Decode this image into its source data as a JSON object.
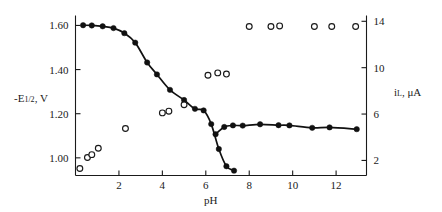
{
  "chart_data": {
    "type": "scatter",
    "title": "",
    "subtitle": "",
    "xlabel": "pH",
    "ylabel": "-E1/2, V",
    "y2label": "iL, uA",
    "xlim": [
      0.0,
      13.4
    ],
    "ylim": [
      0.92,
      1.645
    ],
    "y2lim": [
      0.7,
      14.5
    ],
    "grid": false,
    "legend": "none",
    "xticks": [
      2,
      4,
      6,
      8,
      10,
      12
    ],
    "xtick_labels": [
      "2",
      "4",
      "6",
      "8",
      "10",
      "12"
    ],
    "yticks": [
      1.0,
      1.2,
      1.4,
      1.6
    ],
    "ytick_labels": [
      "1.00",
      "1.20",
      "1.40",
      "1.60"
    ],
    "y2ticks": [
      2,
      6,
      10,
      14
    ],
    "y2tick_labels": [
      "2",
      "6",
      "10",
      "14"
    ],
    "series": [
      {
        "name": "-E1/2 vs pH (upper branch)",
        "marker": "filled-circle",
        "axis": "left",
        "connected": true,
        "x": [
          0.35,
          0.75,
          1.25,
          1.75,
          2.25,
          2.75,
          3.3,
          3.75,
          4.35,
          5.0,
          5.5,
          5.9,
          6.25,
          6.6,
          6.95,
          7.3
        ],
        "y": [
          1.601,
          1.6,
          1.596,
          1.588,
          1.565,
          1.522,
          1.432,
          1.378,
          1.308,
          1.262,
          1.222,
          1.215,
          1.153,
          1.04,
          0.962,
          0.942
        ]
      },
      {
        "name": "-E1/2 vs pH (lower plateau branch)",
        "marker": "filled-circle",
        "axis": "left",
        "connected": true,
        "x": [
          6.45,
          6.85,
          7.25,
          7.7,
          8.5,
          9.35,
          9.85,
          10.9,
          11.7,
          12.95
        ],
        "y": [
          1.107,
          1.14,
          1.147,
          1.146,
          1.152,
          1.148,
          1.147,
          1.136,
          1.138,
          1.13
        ]
      },
      {
        "name": "iL vs pH",
        "marker": "open-circle",
        "axis": "right",
        "connected": false,
        "x": [
          0.2,
          0.55,
          0.75,
          1.05,
          2.3,
          4.0,
          4.3,
          5.0,
          6.1,
          6.55,
          6.95,
          8.0,
          9.0,
          9.4,
          11.0,
          11.8,
          12.9
        ],
        "y": [
          1.3,
          2.25,
          2.5,
          3.05,
          4.75,
          6.1,
          6.25,
          6.8,
          9.35,
          9.55,
          9.45,
          13.55,
          13.55,
          13.6,
          13.55,
          13.55,
          13.55
        ]
      }
    ]
  },
  "axis_labels": {
    "left_main": "-E",
    "left_sub": "1/2",
    "left_tail": ", V",
    "right_main": "i",
    "right_sub": "L",
    "right_tail": ",  μA",
    "bottom": "pH"
  }
}
